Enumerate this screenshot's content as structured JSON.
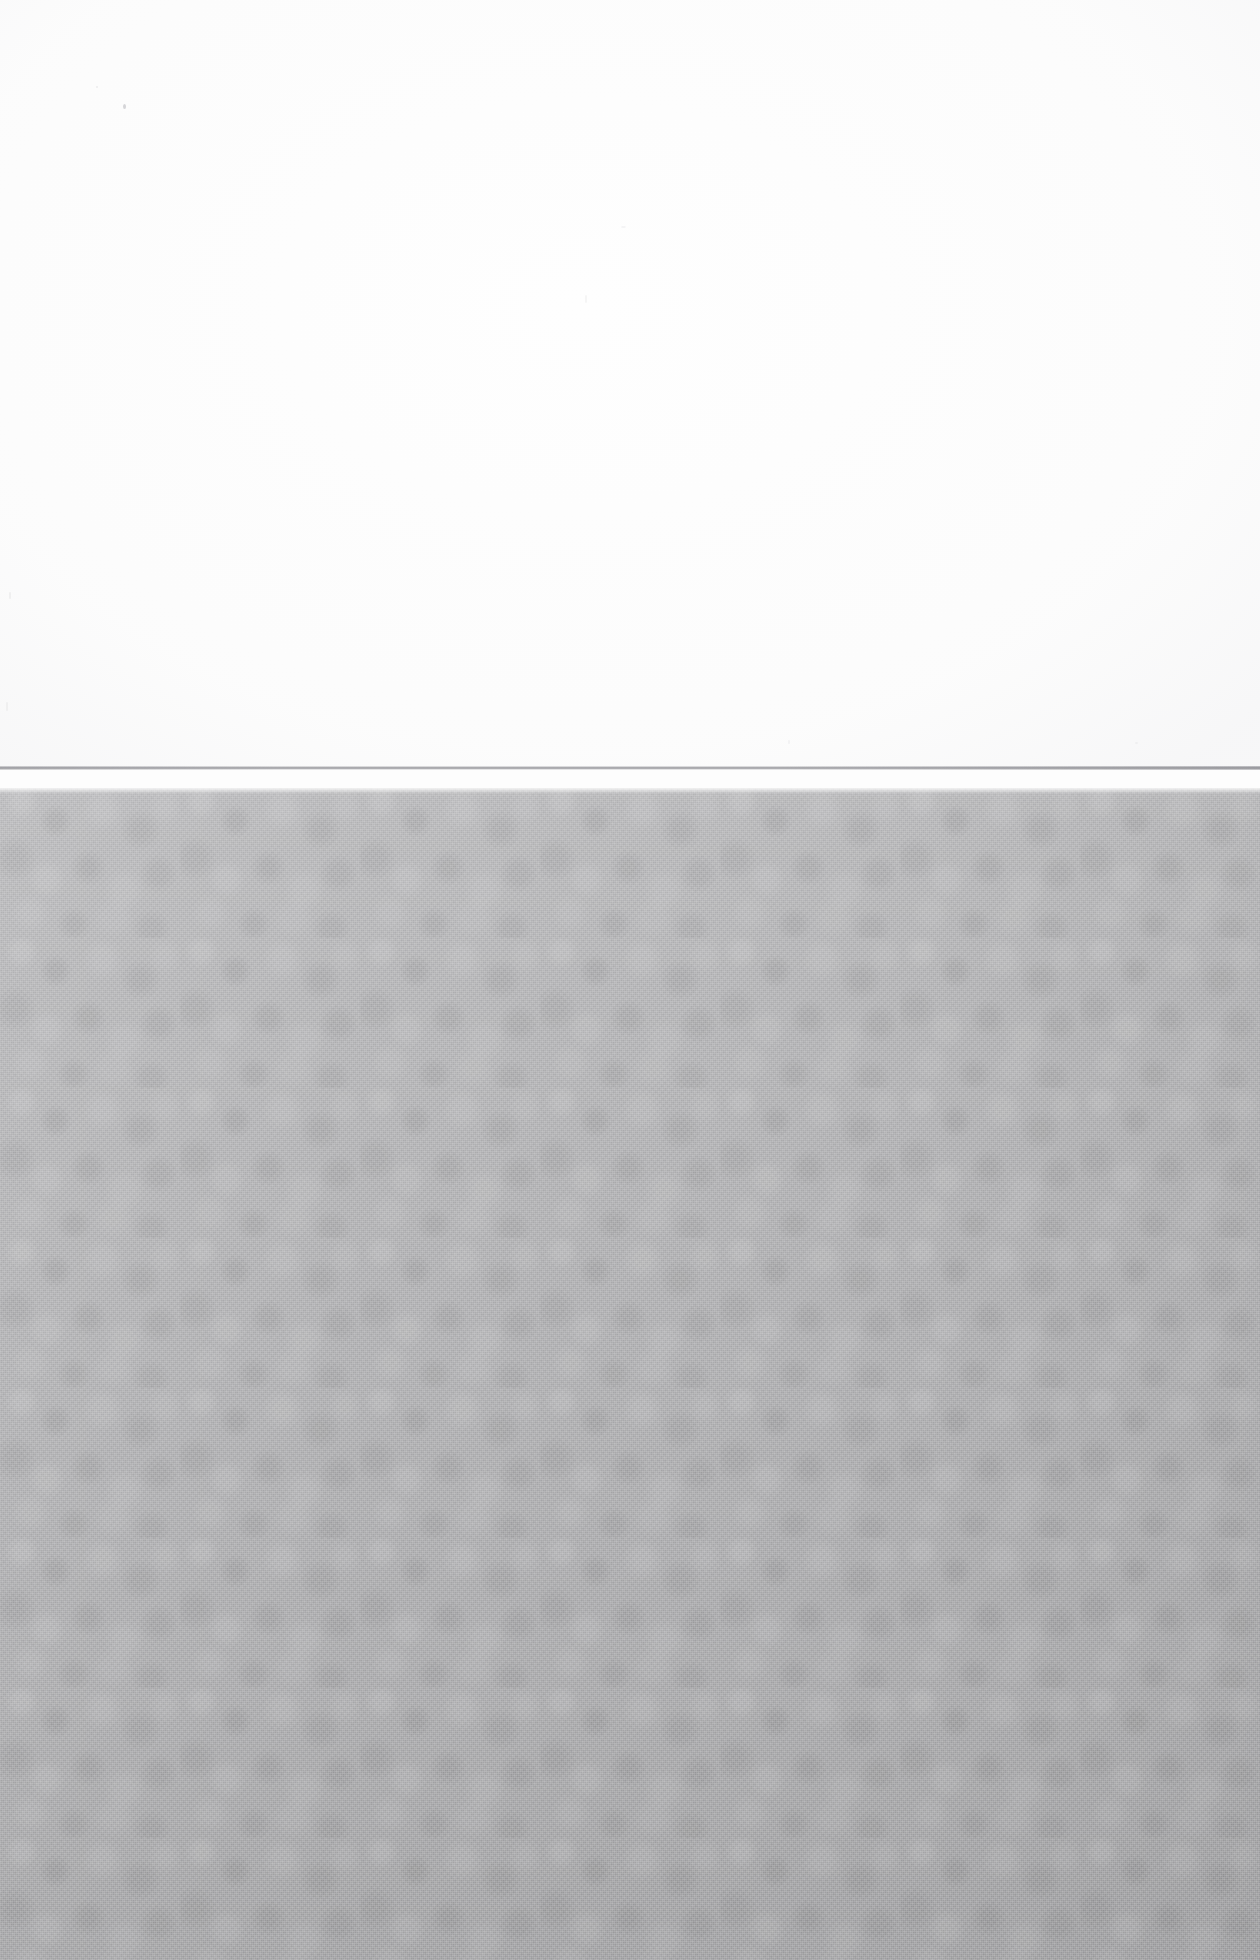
{
  "image": {
    "kind": "scanned-blank-surface",
    "width": 1260,
    "height": 1960,
    "has_text": false,
    "has_ui_chrome": false,
    "description": "Blank scan: white paper field above a thin horizontal rule, noisy mid-gray textured field below"
  },
  "regions": {
    "white_field": {
      "name": "white-paper-area",
      "top": 0,
      "height": 767,
      "color": "#fefefe",
      "content": ""
    },
    "seam_line": {
      "name": "horizontal-rule",
      "top": 766,
      "height": 4,
      "color": "#9b9ba0",
      "content": ""
    },
    "seam_gap": {
      "name": "white-gap",
      "top": 770,
      "height": 18,
      "color": "#fdfdfd",
      "content": ""
    },
    "gray_field": {
      "name": "gray-textured-area",
      "top": 788,
      "height": 1172,
      "color": "#b4b4b6",
      "color_top": "#bcbcbe",
      "color_bottom": "#a9a9ac",
      "content": ""
    }
  },
  "artifacts": {
    "label": "dust-specks",
    "count": 8,
    "color": "#b9b9bd"
  }
}
